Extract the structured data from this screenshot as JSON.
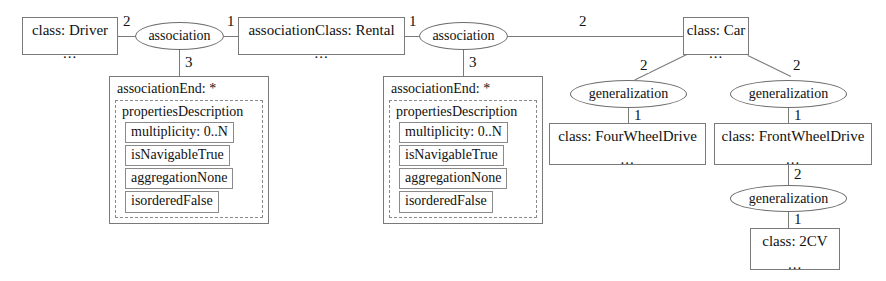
{
  "diagram": {
    "dots": "...",
    "nodes": {
      "driver": {
        "label": "class: Driver"
      },
      "assoc1": {
        "label": "association"
      },
      "rental": {
        "label": "associationClass: Rental"
      },
      "assoc2": {
        "label": "association"
      },
      "car": {
        "label": "class: Car"
      },
      "gen_left": {
        "label": "generalization"
      },
      "gen_right": {
        "label": "generalization"
      },
      "gen_bottom": {
        "label": "generalization"
      },
      "four_wheel": {
        "label": "class: FourWheelDrive"
      },
      "front_wheel": {
        "label": "class: FrontWheelDrive"
      },
      "twocv": {
        "label": "class: 2CV"
      }
    },
    "association_ends": [
      {
        "title": "associationEnd: *",
        "properties_title": "propertiesDescription",
        "properties": [
          "multiplicity: 0..N",
          "isNavigableTrue",
          "aggregationNone",
          "isorderedFalse"
        ]
      },
      {
        "title": "associationEnd: *",
        "properties_title": "propertiesDescription",
        "properties": [
          "multiplicity: 0..N",
          "isNavigableTrue",
          "aggregationNone",
          "isorderedFalse"
        ]
      }
    ],
    "edge_labels": {
      "driver_assoc1": "2",
      "assoc1_rental": "1",
      "assoc1_end": "3",
      "rental_assoc2": "1",
      "assoc2_end": "3",
      "assoc2_car": "2",
      "car_gen_left": "2",
      "car_gen_right": "2",
      "gen_left_four": "1",
      "gen_right_front": "1",
      "front_gen_bottom": "2",
      "gen_bottom_twocv": "1"
    },
    "colors": {
      "stroke": "#7a7a7a",
      "text": "#111111",
      "background": "#ffffff"
    }
  }
}
